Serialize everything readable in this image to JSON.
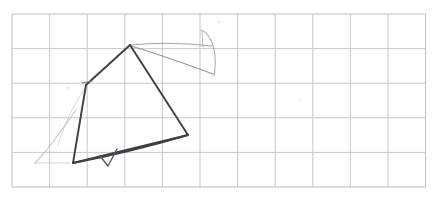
{
  "image": {
    "kind": "hand-drawn-sketch-on-graph-paper",
    "title": "Pencil sketch of a tent-like quadrilateral on grid paper",
    "width": 439,
    "height": 215,
    "background_color": "#ffffff"
  },
  "grid": {
    "label": "graph-paper-grid",
    "line_color": "#c9c9c9",
    "border_color": "#bdbdbd",
    "line_width": 1,
    "x_start": 12,
    "y_start": 14,
    "cell_width": 37.6,
    "cell_height": 34.6,
    "columns": 11,
    "rows": 5,
    "x_end": 425.6,
    "y_end": 187,
    "vertical_lines": [
      12,
      49.6,
      87.2,
      124.8,
      162.4,
      200,
      237.6,
      275.2,
      312.8,
      350.4,
      388,
      425.6
    ],
    "horizontal_lines": [
      14,
      48.6,
      83.2,
      117.8,
      152.4,
      187
    ]
  },
  "strokes": {
    "main_outline": {
      "label": "tent-outline",
      "color": "#3f3f46",
      "width": 1.9,
      "description": "Dark pencil quadrilateral: apex at top, left shoulder, bottom-left corner, right corner",
      "points": [
        [
          130,
          45
        ],
        [
          86,
          85
        ],
        [
          73,
          163
        ],
        [
          188,
          135
        ],
        [
          130,
          45
        ]
      ]
    },
    "bottom_curve": {
      "label": "bottom-curved-edge",
      "color": "#3f3f46",
      "width": 1.9,
      "description": "Slightly bowed baseline sweeping from bottom-left corner up to the right corner",
      "path": "M 73 163 Q 130 152 188 135"
    },
    "small_notch": {
      "label": "baseline-notch",
      "color": "#5a5a60",
      "width": 1.4,
      "description": "Small V notch / tick mark drawn on the baseline near bottom center",
      "path": "M 100 156 L 108 166 L 117 149"
    },
    "ridge_line_upper": {
      "label": "faint-ridge-line-upper",
      "color": "#9b9b9f",
      "width": 1.1,
      "description": "Faint near-horizontal line from apex running right toward the arc",
      "path": "M 130 45 C 160 42 186 43 212 46"
    },
    "ridge_line_lower": {
      "label": "faint-ridge-line-lower",
      "color": "#8a8a8f",
      "width": 1.2,
      "description": "Faint descending line from apex sloping down-right to the arc foot",
      "path": "M 131 46 C 158 54 186 64 213 74"
    },
    "right_arc": {
      "label": "faint-right-arc",
      "color": "#a8a8ac",
      "width": 1.1,
      "description": "Faint hook-shaped arc on the right, curving from top down to a vertical stem",
      "path": "M 201 30 C 209 33 214 44 215 56 C 215.8 64 215 70 214 76"
    },
    "right_arc_stem": {
      "label": "faint-arc-stem",
      "color": "#b0b0b4",
      "width": 1.0,
      "description": "Short faint vertical stroke under the arc's left start",
      "path": "M 202 31 L 203 47"
    },
    "left_guide": {
      "label": "faint-left-guide-line",
      "color": "#c2c2c6",
      "width": 1.2,
      "description": "Faint light construction line parallel to the dark left edge",
      "path": "M 76 110 C 60 133 46 152 35 163"
    },
    "left_guide_tail": {
      "label": "faint-left-guide-tail",
      "color": "#cccccf",
      "width": 1.0,
      "description": "Faint continuation of the left guide curving toward the baseline",
      "path": "M 35 163 C 46 163 58 163 70 163"
    },
    "left_inner_guide": {
      "label": "faint-inner-left-guide",
      "color": "#d2d2d5",
      "width": 1.0,
      "description": "Very faint arc inside the left flank of the shape",
      "path": "M 97 72 C 80 92 66 118 58 145"
    },
    "shoulder_tick": {
      "label": "left-shoulder-tick",
      "color": "#7d7d83",
      "width": 1.2,
      "description": "Small tick at the left shoulder vertex where the two dark edges meet",
      "path": "M 82 83 L 92 81"
    },
    "smudges": [
      {
        "label": "smudge-dot-left",
        "x": 68,
        "y": 88,
        "r": 1.0,
        "color": "#d8d8da"
      },
      {
        "label": "smudge-dot-center",
        "x": 219,
        "y": 22,
        "r": 0.9,
        "color": "#dedee0"
      },
      {
        "label": "smudge-dot-right",
        "x": 300,
        "y": 100,
        "r": 0.8,
        "color": "#e2e2e4"
      }
    ]
  }
}
